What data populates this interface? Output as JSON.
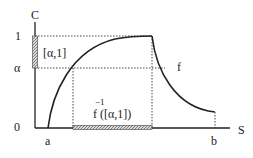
{
  "diagram": {
    "axes": {
      "y_label": "C",
      "x_label": "S",
      "y_ticks": [
        "1",
        "α",
        "0"
      ],
      "x_ticks": [
        "a",
        "b"
      ]
    },
    "curve_label": "f",
    "interval_label": "[α,1]",
    "preimage_label": {
      "superscript": "−1",
      "text": "f ([α,1])"
    },
    "colors": {
      "line": "#222222",
      "hatch": "#8a8a8a",
      "background": "#ffffff"
    }
  }
}
